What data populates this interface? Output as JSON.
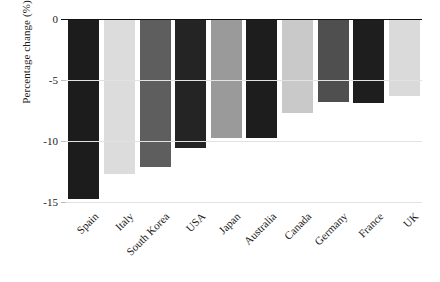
{
  "chart_data": {
    "type": "bar",
    "title": "",
    "xlabel": "",
    "ylabel": "Percentage change (%)",
    "categories": [
      "Spain",
      "Italy",
      "South Korea",
      "USA",
      "Japan",
      "Australia",
      "Canada",
      "Germany",
      "France",
      "UK"
    ],
    "values": [
      -14.8,
      -12.7,
      -12.1,
      -10.6,
      -9.8,
      -9.8,
      -7.7,
      -6.8,
      -6.9,
      -6.3
    ],
    "bar_colors": [
      "#1c1c1c",
      "#dcdcdc",
      "#5e5e5e",
      "#242424",
      "#9a9a9a",
      "#1d1d1d",
      "#c9c9c9",
      "#4f4f4f",
      "#1e1e1e",
      "#dadada"
    ],
    "ylim": [
      -15.5,
      0
    ],
    "yticks": [
      0,
      -5,
      -10,
      -15
    ],
    "ytick_labels": [
      "0",
      "-5",
      "-10",
      "-15"
    ],
    "grid": true,
    "grid_axis": "y",
    "legend": false,
    "legend_position": "none",
    "xtick_rotation": -45
  }
}
